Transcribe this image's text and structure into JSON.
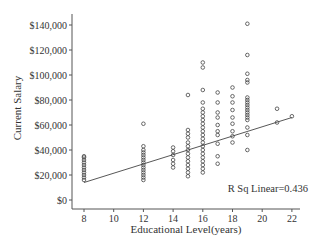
{
  "chart_data": {
    "type": "scatter",
    "title": "",
    "xlabel": "Educational Level(years)",
    "ylabel": "Current Salary",
    "xlim": [
      7.3,
      22.6
    ],
    "ylim": [
      -8000,
      148000
    ],
    "xticks": [
      8,
      10,
      12,
      14,
      16,
      18,
      20,
      22
    ],
    "xtick_labels": [
      "8",
      "10",
      "12",
      "14",
      "16",
      "18",
      "20",
      "22"
    ],
    "yticks": [
      0,
      20000,
      40000,
      60000,
      80000,
      100000,
      120000,
      140000
    ],
    "ytick_labels": [
      "$0",
      "$20,000",
      "$40,000",
      "$60,000",
      "$80,000",
      "$100,000",
      "$120,000",
      "$140,000"
    ],
    "grid": false,
    "marker": "open-circle",
    "series": [
      {
        "name": "Current Salary by Educational Level",
        "points": [
          [
            8,
            16000
          ],
          [
            8,
            18000
          ],
          [
            8,
            20000
          ],
          [
            8,
            22000
          ],
          [
            8,
            24000
          ],
          [
            8,
            26000
          ],
          [
            8,
            28000
          ],
          [
            8,
            30000
          ],
          [
            8,
            32000
          ],
          [
            8,
            34000
          ],
          [
            8,
            35000
          ],
          [
            12,
            16000
          ],
          [
            12,
            18000
          ],
          [
            12,
            20000
          ],
          [
            12,
            22000
          ],
          [
            12,
            24000
          ],
          [
            12,
            26000
          ],
          [
            12,
            28000
          ],
          [
            12,
            30000
          ],
          [
            12,
            32000
          ],
          [
            12,
            34000
          ],
          [
            12,
            36000
          ],
          [
            12,
            38000
          ],
          [
            12,
            40000
          ],
          [
            12,
            43000
          ],
          [
            12,
            61000
          ],
          [
            14,
            26000
          ],
          [
            14,
            29000
          ],
          [
            14,
            32000
          ],
          [
            14,
            36000
          ],
          [
            14,
            39000
          ],
          [
            14,
            42000
          ],
          [
            15,
            19000
          ],
          [
            15,
            22000
          ],
          [
            15,
            25000
          ],
          [
            15,
            28000
          ],
          [
            15,
            31000
          ],
          [
            15,
            34000
          ],
          [
            15,
            37000
          ],
          [
            15,
            40000
          ],
          [
            15,
            43000
          ],
          [
            15,
            46000
          ],
          [
            15,
            50000
          ],
          [
            15,
            53000
          ],
          [
            15,
            56000
          ],
          [
            15,
            84000
          ],
          [
            16,
            22000
          ],
          [
            16,
            25000
          ],
          [
            16,
            28000
          ],
          [
            16,
            31000
          ],
          [
            16,
            34000
          ],
          [
            16,
            37000
          ],
          [
            16,
            40000
          ],
          [
            16,
            43000
          ],
          [
            16,
            46000
          ],
          [
            16,
            49000
          ],
          [
            16,
            52000
          ],
          [
            16,
            55000
          ],
          [
            16,
            58000
          ],
          [
            16,
            61000
          ],
          [
            16,
            64000
          ],
          [
            16,
            67000
          ],
          [
            16,
            70000
          ],
          [
            16,
            73000
          ],
          [
            16,
            78000
          ],
          [
            16,
            88000
          ],
          [
            16,
            106000
          ],
          [
            16,
            110000
          ],
          [
            17,
            29000
          ],
          [
            17,
            35000
          ],
          [
            17,
            45000
          ],
          [
            17,
            52000
          ],
          [
            17,
            55000
          ],
          [
            17,
            60000
          ],
          [
            17,
            66000
          ],
          [
            17,
            70000
          ],
          [
            17,
            78000
          ],
          [
            17,
            86000
          ],
          [
            18,
            46000
          ],
          [
            18,
            51000
          ],
          [
            18,
            55000
          ],
          [
            18,
            61000
          ],
          [
            18,
            66000
          ],
          [
            18,
            72000
          ],
          [
            18,
            78000
          ],
          [
            18,
            83000
          ],
          [
            18,
            90000
          ],
          [
            19,
            40000
          ],
          [
            19,
            52000
          ],
          [
            19,
            58000
          ],
          [
            19,
            64000
          ],
          [
            19,
            66000
          ],
          [
            19,
            68000
          ],
          [
            19,
            70000
          ],
          [
            19,
            72000
          ],
          [
            19,
            74000
          ],
          [
            19,
            76000
          ],
          [
            19,
            78000
          ],
          [
            19,
            80000
          ],
          [
            19,
            82000
          ],
          [
            19,
            94000
          ],
          [
            19,
            96000
          ],
          [
            19,
            101000
          ],
          [
            19,
            116000
          ],
          [
            19,
            141000
          ],
          [
            21,
            62000
          ],
          [
            21,
            73000
          ],
          [
            22,
            67000
          ]
        ]
      }
    ],
    "fit_line": {
      "type": "linear",
      "from": [
        8,
        14000
      ],
      "to": [
        22,
        66000
      ]
    },
    "annotations": [
      {
        "text": "R Sq Linear=0.436",
        "position": "bottom-right"
      }
    ]
  }
}
